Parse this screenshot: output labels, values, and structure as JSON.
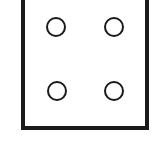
{
  "diagram": {
    "stroke_color": "#1a1a1a",
    "background": "#ffffff",
    "box": {
      "left": 23,
      "right": 147,
      "top": -5,
      "bottom": 128,
      "stroke_width": 4
    },
    "circles": [
      {
        "id": "top-left",
        "cx": 56,
        "cy": 27,
        "r": 9
      },
      {
        "id": "top-right",
        "cx": 114,
        "cy": 27,
        "r": 9
      },
      {
        "id": "bottom-left",
        "cx": 57,
        "cy": 91,
        "r": 9
      },
      {
        "id": "bottom-right",
        "cx": 114,
        "cy": 91,
        "r": 9
      }
    ]
  }
}
